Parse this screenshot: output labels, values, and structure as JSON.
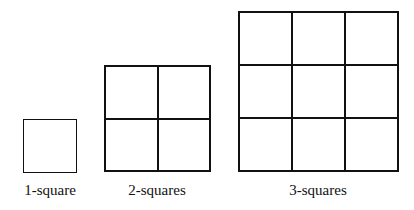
{
  "figures": [
    {
      "n": 1,
      "label": "1-square",
      "x": 23,
      "y": 119,
      "size": 54,
      "label_x": 50,
      "label_y": 183
    },
    {
      "n": 2,
      "label": "2-squares",
      "x": 104,
      "y": 65,
      "size": 107,
      "label_x": 157,
      "label_y": 183
    },
    {
      "n": 3,
      "label": "3-squares",
      "x": 238,
      "y": 11,
      "size": 161,
      "label_x": 318,
      "label_y": 183
    }
  ],
  "colors": {
    "line": "#111111",
    "background": "#ffffff"
  }
}
